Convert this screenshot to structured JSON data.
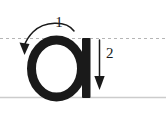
{
  "diagram": {
    "letter": "a",
    "background_color": "#ffffff",
    "ink_color": "#1a1a1a",
    "guide_line_color": "#b9b9b9",
    "baseline_color": "#c9c9c9",
    "guides": {
      "midline_style": "dashed",
      "midline_label": "x-height dashed guide line",
      "baseline_style": "solid",
      "baseline_label": "baseline"
    },
    "strokes": [
      {
        "number": "1",
        "name": "bowl-stroke",
        "direction": "counter-clockwise",
        "arrow_type": "curved",
        "description": "Curved arrow over the top of the bowl, ending with arrowhead pointing down-left"
      },
      {
        "number": "2",
        "name": "stem-stroke",
        "direction": "downward",
        "arrow_type": "straight",
        "description": "Straight vertical arrow pointing down beside the stem"
      }
    ]
  }
}
